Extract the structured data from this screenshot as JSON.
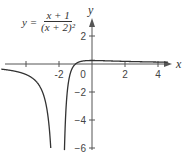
{
  "chart_data": {
    "type": "line",
    "title": "",
    "equation": {
      "lhs": "y =",
      "numerator": "x + 1",
      "denominator": "(x + 2)²"
    },
    "xlabel": "x",
    "ylabel": "y",
    "xlim": [
      -5.5,
      4.6
    ],
    "ylim": [
      -6.2,
      3.5
    ],
    "x_ticks": [
      -4,
      -2,
      0,
      2,
      4
    ],
    "x_tick_labels": [
      "-2",
      "0",
      "2",
      "4"
    ],
    "y_ticks": [
      2,
      -2,
      -4,
      -6
    ],
    "y_tick_labels": [
      "2",
      "−2",
      "−4",
      "−6"
    ],
    "vertical_asymptote": -2,
    "grid": false,
    "series": [
      {
        "name": "y=(x+1)/(x+2)^2",
        "function": "(x+1)/(x+2)^2",
        "x_range": [
          -5.5,
          4.6
        ]
      }
    ],
    "colors": {
      "curve": "#333333",
      "axis": "#555555"
    }
  }
}
